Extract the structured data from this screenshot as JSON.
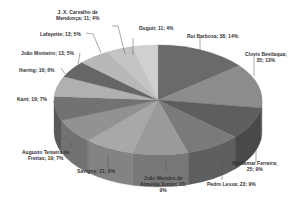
{
  "chart_data": {
    "type": "pie",
    "style": "3d-pie-grayscale",
    "title": "",
    "legend": "none",
    "slices": [
      {
        "label": "Rui Barbosa",
        "value": 38,
        "percent": "14%",
        "display": "Rui Barbosa; 38; 14%",
        "color": "#6a6a6a"
      },
      {
        "label": "Clovis Bevilaqua",
        "value": 35,
        "percent": "13%",
        "display": "Clovis Bevilaqua; 35; 13%",
        "color": "#8c8c8c"
      },
      {
        "label": "Waldemar Ferreira",
        "value": 25,
        "percent": "9%",
        "display": "Waldemar Ferreira; 25; 9%",
        "color": "#5e5e5e"
      },
      {
        "label": "Pedro Lessa",
        "value": 23,
        "percent": "9%",
        "display": "Pedro Lessa; 23; 9%",
        "color": "#7a7a7a"
      },
      {
        "label": "João Mendes de Almeida Junior",
        "value": 23,
        "percent": "9%",
        "display": "João Mendes de Almeida Junior; 23; 9%",
        "color": "#9a9a9a"
      },
      {
        "label": "Savigny",
        "value": 21,
        "percent": "8%",
        "display": "Savigny; 21; 8%",
        "color": "#a8a8a8"
      },
      {
        "label": "Augusto Teixeira de Freitas",
        "value": 19,
        "percent": "7%",
        "display": "Augusto Teixeira de Freitas; 19; 7%",
        "color": "#929292"
      },
      {
        "label": "Kant",
        "value": 19,
        "percent": "7%",
        "display": "Kant; 19; 7%",
        "color": "#727272"
      },
      {
        "label": "Ihering",
        "value": 16,
        "percent": "6%",
        "display": "Ihering; 16; 6%",
        "color": "#b0b0b0"
      },
      {
        "label": "João Monteiro",
        "value": 13,
        "percent": "5%",
        "display": "João Monteiro; 13; 5%",
        "color": "#666666"
      },
      {
        "label": "Lafayette",
        "value": 13,
        "percent": "5%",
        "display": "Lafayette; 13; 5%",
        "color": "#b8b8b8"
      },
      {
        "label": "J. X. Carvalho de Mendonça",
        "value": 11,
        "percent": "4%",
        "display": "J. X. Carvalho de Mendonça; 11; 4%",
        "color": "#c4c4c4"
      },
      {
        "label": "Duguit",
        "value": 11,
        "percent": "4%",
        "display": "Duguit; 11; 4%",
        "color": "#d0d0d0"
      }
    ]
  },
  "labels": {
    "rui": "Rui Barbosa; 38; 14%",
    "clovis_1": "Clovis Bevilaqua;",
    "clovis_2": "35; 13%",
    "waldemar_1": "Waldemar Ferreira;",
    "waldemar_2": "25; 9%",
    "pedro": "Pedro Lessa; 23; 9%",
    "joao_mendes_1": "João Mendes de",
    "joao_mendes_2": "Almeida Junior; 23;",
    "joao_mendes_3": "9%",
    "savigny": "Savigny; 21; 8%",
    "augusto_1": "Augusto Teixeira de",
    "augusto_2": "Freitas; 19; 7%",
    "kant": "Kant; 19; 7%",
    "ihering": "Ihering; 16; 6%",
    "joao_monteiro": "João Monteiro; 13; 5%",
    "lafayette": "Lafayette; 13; 5%",
    "carvalho_1": "J. X. Carvalho de",
    "carvalho_2": "Mendonça; 11; 4%",
    "duguit": "Duguit; 11; 4%"
  }
}
